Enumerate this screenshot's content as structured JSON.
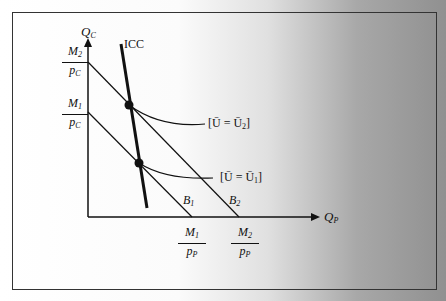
{
  "diagram": {
    "y_axis_label": "Q",
    "y_axis_sub": "C",
    "x_axis_label": "Q",
    "x_axis_sub": "P",
    "icc_label": "ICC",
    "budget_lines": [
      {
        "label": "B",
        "sub": "1"
      },
      {
        "label": "B",
        "sub": "2"
      }
    ],
    "indifference_labels": [
      "[Ū = Ū₂]",
      "[Ū = Ū₁]"
    ],
    "y_intercepts": [
      {
        "num": "M₂",
        "den": "p_C"
      },
      {
        "num": "M₁",
        "den": "p_C"
      }
    ],
    "x_intercepts": [
      {
        "num": "M₁",
        "den": "p_P"
      },
      {
        "num": "M₂",
        "den": "p_P"
      }
    ],
    "y_frac": {
      "m2": "M",
      "m2sub": "2",
      "m1": "M",
      "m1sub": "1",
      "den": "p",
      "densub": "C"
    },
    "x_frac": {
      "m1": "M",
      "m1sub": "1",
      "m2": "M",
      "m2sub": "2",
      "den": "p",
      "densub": "P"
    },
    "ind_u2": "[Ū = Ū",
    "ind_u2_sub": "2",
    "ind_u1": "[Ū = Ū",
    "ind_u1_sub": "1",
    "ind_close": "]"
  }
}
